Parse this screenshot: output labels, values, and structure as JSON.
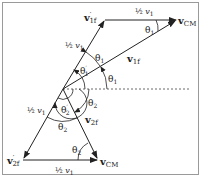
{
  "diagram": {
    "type": "velocity-vector-diagram",
    "labels": {
      "v1f_prime": "v′1f",
      "v1f": "v1f",
      "v2f_prime": "v′2f",
      "v2f": "v2f",
      "vcm_top": "vCM",
      "vcm_bottom": "vCM",
      "half_v1_top": "½ v1",
      "half_v1_left_upper": "½ v1",
      "half_v1_left_lower": "½ v1",
      "half_v1_bottom": "½ v1",
      "theta1_top_corner": "θ1",
      "theta1_inner": "θ1",
      "theta1_right": "θ1",
      "theta1_prime": "θ′1",
      "theta2_prime": "θ′2",
      "theta2_right": "θ2",
      "theta2_inner": "θ2",
      "theta2_bottom_corner": "θ2"
    },
    "parts": {
      "v": "v",
      "sub_1f": "1f",
      "sub_2f": "2f",
      "sub_CM": "CM",
      "prime": "′",
      "theta": "θ",
      "sub_1": "1",
      "sub_2": "2",
      "half": "½",
      "v1": "v",
      "v1_sub": "1"
    },
    "colors": {
      "stroke": "#222222",
      "frame": "#9a9a9a"
    }
  }
}
